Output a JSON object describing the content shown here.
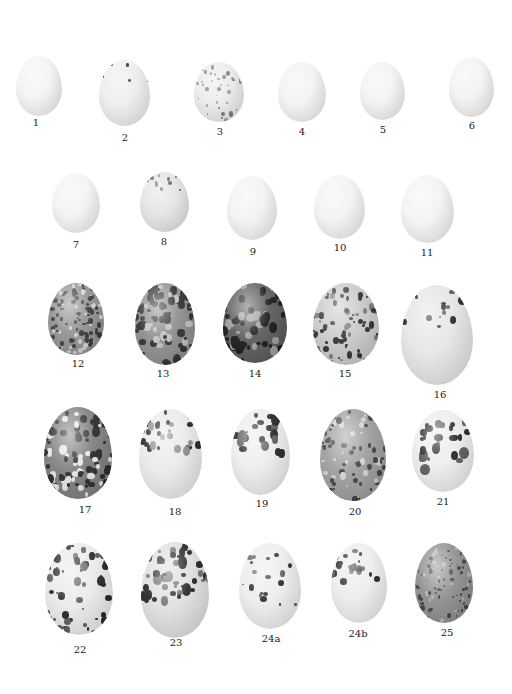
{
  "plate": {
    "eggs": [
      {
        "label": "1",
        "x": 16,
        "y": 56,
        "w": 46,
        "h": 60,
        "lx": 36,
        "ly": 121,
        "type": "plain",
        "base": "#f3f3f3"
      },
      {
        "label": "2",
        "x": 99,
        "y": 60,
        "w": 51,
        "h": 66,
        "lx": 125,
        "ly": 136,
        "type": "dots",
        "base": "#ececec",
        "pattern": "top-few"
      },
      {
        "label": "3",
        "x": 194,
        "y": 62,
        "w": 50,
        "h": 60,
        "lx": 220,
        "ly": 130,
        "type": "speckle",
        "base": "#eaeaea",
        "pattern": "fine-grey"
      },
      {
        "label": "4",
        "x": 278,
        "y": 62,
        "w": 48,
        "h": 60,
        "lx": 302,
        "ly": 130,
        "type": "plain",
        "base": "#f2f2f2"
      },
      {
        "label": "5",
        "x": 360,
        "y": 62,
        "w": 45,
        "h": 58,
        "lx": 383,
        "ly": 128,
        "type": "plain",
        "base": "#f2f2f2"
      },
      {
        "label": "6",
        "x": 449,
        "y": 57,
        "w": 45,
        "h": 60,
        "lx": 472,
        "ly": 124,
        "type": "plain",
        "base": "#f2f2f2"
      },
      {
        "label": "7",
        "x": 52,
        "y": 173,
        "w": 48,
        "h": 60,
        "lx": 76,
        "ly": 243,
        "type": "plain",
        "base": "#f3f3f3"
      },
      {
        "label": "8",
        "x": 140,
        "y": 172,
        "w": 49,
        "h": 60,
        "lx": 164,
        "ly": 240,
        "type": "speckle",
        "base": "#e3e3e3",
        "pattern": "cap"
      },
      {
        "label": "9",
        "x": 227,
        "y": 176,
        "w": 50,
        "h": 64,
        "lx": 253,
        "ly": 250,
        "type": "plain",
        "base": "#f2f2f2"
      },
      {
        "label": "10",
        "x": 314,
        "y": 175,
        "w": 51,
        "h": 64,
        "lx": 340,
        "ly": 246,
        "type": "plain",
        "base": "#f2f2f2"
      },
      {
        "label": "11",
        "x": 401,
        "y": 175,
        "w": 53,
        "h": 68,
        "lx": 427,
        "ly": 251,
        "type": "plain",
        "base": "#f3f3f3"
      },
      {
        "label": "12",
        "x": 48,
        "y": 283,
        "w": 56,
        "h": 72,
        "lx": 78,
        "ly": 362,
        "type": "heavy",
        "base": "#8e8e8e",
        "pattern": "mottled"
      },
      {
        "label": "13",
        "x": 135,
        "y": 283,
        "w": 60,
        "h": 82,
        "lx": 163,
        "ly": 372,
        "type": "heavy",
        "base": "#8a8a8a",
        "pattern": "streaky"
      },
      {
        "label": "14",
        "x": 223,
        "y": 283,
        "w": 64,
        "h": 80,
        "lx": 255,
        "ly": 372,
        "type": "heavy",
        "base": "#555555",
        "pattern": "dark"
      },
      {
        "label": "15",
        "x": 313,
        "y": 283,
        "w": 66,
        "h": 82,
        "lx": 345,
        "ly": 372,
        "type": "heavy",
        "base": "#c8c8c8",
        "pattern": "streaky-light"
      },
      {
        "label": "16",
        "x": 401,
        "y": 285,
        "w": 72,
        "h": 100,
        "lx": 440,
        "ly": 393,
        "type": "dots",
        "base": "#e4e4e4",
        "pattern": "sparse-blotch"
      },
      {
        "label": "17",
        "x": 44,
        "y": 407,
        "w": 68,
        "h": 92,
        "lx": 85,
        "ly": 508,
        "type": "heavy",
        "base": "#7a7a7a",
        "pattern": "blotched"
      },
      {
        "label": "18",
        "x": 139,
        "y": 409,
        "w": 63,
        "h": 90,
        "lx": 175,
        "ly": 510,
        "type": "dots",
        "base": "#e9e9e9",
        "pattern": "cap-blotch"
      },
      {
        "label": "19",
        "x": 231,
        "y": 409,
        "w": 59,
        "h": 86,
        "lx": 262,
        "ly": 502,
        "type": "dots",
        "base": "#ececec",
        "pattern": "cap-heavy"
      },
      {
        "label": "20",
        "x": 320,
        "y": 409,
        "w": 66,
        "h": 92,
        "lx": 355,
        "ly": 510,
        "type": "heavy",
        "base": "#9a9a9a",
        "pattern": "spotted"
      },
      {
        "label": "21",
        "x": 412,
        "y": 410,
        "w": 62,
        "h": 82,
        "lx": 443,
        "ly": 500,
        "type": "dots",
        "base": "#ececec",
        "pattern": "bold-spots"
      },
      {
        "label": "22",
        "x": 45,
        "y": 543,
        "w": 68,
        "h": 92,
        "lx": 80,
        "ly": 648,
        "type": "dots",
        "base": "#e9e9e9",
        "pattern": "dense-spots"
      },
      {
        "label": "23",
        "x": 141,
        "y": 542,
        "w": 68,
        "h": 96,
        "lx": 176,
        "ly": 641,
        "type": "dots",
        "base": "#dedede",
        "pattern": "cap-dense"
      },
      {
        "label": "24a",
        "x": 239,
        "y": 543,
        "w": 62,
        "h": 86,
        "lx": 271,
        "ly": 637,
        "type": "dots",
        "base": "#ececec",
        "pattern": "scattered"
      },
      {
        "label": "24b",
        "x": 331,
        "y": 543,
        "w": 56,
        "h": 80,
        "lx": 358,
        "ly": 632,
        "type": "dots",
        "base": "#ececec",
        "pattern": "cap-streak"
      },
      {
        "label": "25",
        "x": 415,
        "y": 543,
        "w": 58,
        "h": 80,
        "lx": 447,
        "ly": 631,
        "type": "heavy",
        "base": "#8a8a8a",
        "pattern": "fine-dark"
      }
    ]
  }
}
